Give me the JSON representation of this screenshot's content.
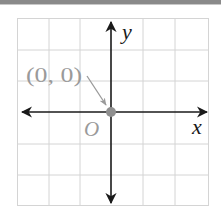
{
  "diagram": {
    "type": "coordinate-plane",
    "x_axis_label": "x",
    "y_axis_label": "y",
    "origin_label": "O",
    "point_label": "(0, 0)",
    "point": {
      "x": 0,
      "y": 0
    },
    "grid": {
      "columns": 6,
      "rows": 6,
      "color": "#d4d4d4"
    },
    "colors": {
      "axis": "#1a1a1a",
      "point": "#8f8f8f",
      "label_gray": "#9a9a9a",
      "topbar": "#8a8a8a"
    }
  }
}
